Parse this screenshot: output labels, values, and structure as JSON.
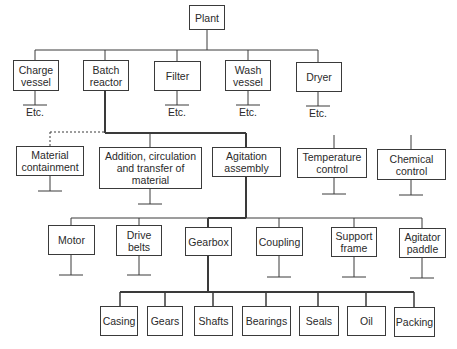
{
  "diagram": {
    "root": {
      "label": "Plant"
    },
    "level1": [
      {
        "label": "Charge\nvessel",
        "note": "Etc."
      },
      {
        "label": "Batch\nreactor"
      },
      {
        "label": "Filter",
        "note": "Etc."
      },
      {
        "label": "Wash\nvessel",
        "note": "Etc."
      },
      {
        "label": "Dryer",
        "note": "Etc."
      }
    ],
    "level2": [
      {
        "label": "Material\ncontainment",
        "link": "dashed"
      },
      {
        "label": "Addition, circulation\nand transfer of\nmaterial"
      },
      {
        "label": "Agitation\nassembly"
      },
      {
        "label": "Temperature\ncontrol"
      },
      {
        "label": "Chemical\ncontrol"
      }
    ],
    "level3": [
      {
        "label": "Motor"
      },
      {
        "label": "Drive\nbelts"
      },
      {
        "label": "Gearbox"
      },
      {
        "label": "Coupling"
      },
      {
        "label": "Support\nframe"
      },
      {
        "label": "Agitator\npaddle"
      }
    ],
    "level4": [
      {
        "label": "Casing"
      },
      {
        "label": "Gears"
      },
      {
        "label": "Shafts"
      },
      {
        "label": "Bearings"
      },
      {
        "label": "Seals"
      },
      {
        "label": "Oil"
      },
      {
        "label": "Packing"
      }
    ],
    "colors": {
      "line": "#3a3a3a",
      "text": "#2a2a2a",
      "background": "#ffffff"
    }
  }
}
